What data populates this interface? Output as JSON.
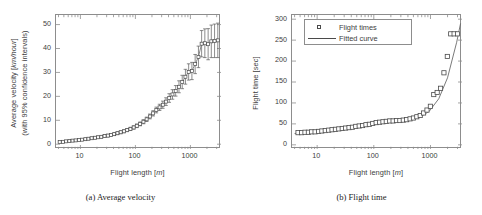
{
  "figure": {
    "panels": [
      {
        "id": "panel-a",
        "caption": "(a) Average velocity",
        "chart_index": 0
      },
      {
        "id": "panel-b",
        "caption": "(b) Flight time",
        "chart_index": 1
      }
    ]
  },
  "chart_data": [
    {
      "type": "scatter",
      "title": "",
      "panel_caption": "(a) Average velocity",
      "xlabel": "Flight length [m]",
      "xlabel_unit_italic": "m",
      "ylabel": "Average velocity [km/hour]",
      "ylabel_line2": "(with 95% confidence intervals)",
      "ylabel_unit_italic": "km/hour",
      "xscale": "log",
      "yscale": "linear",
      "xlim": [
        3.6,
        3600
      ],
      "ylim": [
        -2,
        54
      ],
      "xticks": [
        10,
        100,
        1000
      ],
      "xtick_labels": [
        "10",
        "100",
        "1000"
      ],
      "yticks": [
        0,
        10,
        20,
        30,
        40,
        50
      ],
      "ytick_labels": [
        "0",
        "10",
        "20",
        "30",
        "40",
        "50"
      ],
      "grid": false,
      "legend": null,
      "marker": "open-square",
      "has_error_bars": true,
      "error_bar_label": "95% confidence intervals",
      "series": [
        {
          "name": "Average velocity",
          "x": [
            4.2,
            4.8,
            5.5,
            6.3,
            7.2,
            8.2,
            9.4,
            10.7,
            12.3,
            14.0,
            16.0,
            18.4,
            21.0,
            24.0,
            27.5,
            31.5,
            36.0,
            41.2,
            47.2,
            54.0,
            62.0,
            71.0,
            81.2,
            93.0,
            106,
            122,
            140,
            160,
            183,
            210,
            240,
            275,
            315,
            360,
            412,
            472,
            540,
            620,
            710,
            812,
            930,
            1065,
            1220,
            1400,
            1600,
            1830,
            2100,
            2400,
            2750,
            3150
          ],
          "y": [
            0.9,
            1.0,
            1.2,
            1.3,
            1.5,
            1.6,
            1.8,
            1.9,
            2.1,
            2.3,
            2.5,
            2.7,
            2.9,
            3.1,
            3.4,
            3.6,
            3.9,
            4.2,
            4.6,
            5.0,
            5.4,
            5.9,
            6.4,
            7.0,
            7.7,
            8.5,
            9.4,
            10.4,
            11.6,
            12.9,
            14.3,
            15.4,
            16.5,
            17.8,
            19.3,
            20.8,
            22.3,
            24.0,
            26.0,
            28.2,
            30.2,
            30.6,
            33.5,
            36.5,
            42.0,
            42.2,
            41.8,
            43.0,
            43.2,
            43.4
          ],
          "yerr_lower": [
            0.35,
            0.35,
            0.38,
            0.4,
            0.4,
            0.4,
            0.42,
            0.42,
            0.45,
            0.45,
            0.45,
            0.48,
            0.5,
            0.5,
            0.52,
            0.55,
            0.55,
            0.58,
            0.6,
            0.6,
            0.62,
            0.65,
            0.68,
            0.7,
            0.75,
            0.8,
            0.85,
            0.9,
            1.0,
            1.1,
            1.2,
            1.3,
            1.5,
            1.6,
            1.8,
            2.0,
            2.2,
            2.5,
            2.8,
            3.1,
            3.4,
            3.6,
            4.0,
            4.5,
            5.5,
            6.0,
            6.5,
            6.8,
            7.0,
            7.2
          ],
          "yerr_upper": [
            0.35,
            0.35,
            0.38,
            0.4,
            0.4,
            0.4,
            0.42,
            0.42,
            0.45,
            0.45,
            0.45,
            0.48,
            0.5,
            0.5,
            0.52,
            0.55,
            0.55,
            0.58,
            0.6,
            0.6,
            0.62,
            0.65,
            0.68,
            0.7,
            0.75,
            0.8,
            0.85,
            0.9,
            1.0,
            1.1,
            1.2,
            1.3,
            1.5,
            1.6,
            1.8,
            2.0,
            2.2,
            2.5,
            2.8,
            3.1,
            3.4,
            3.6,
            4.0,
            4.5,
            5.5,
            6.0,
            6.5,
            6.8,
            7.0,
            7.2
          ]
        }
      ]
    },
    {
      "type": "scatter",
      "title": "",
      "panel_caption": "(b) Flight time",
      "xlabel": "Flight length [m]",
      "xlabel_unit_italic": "m",
      "ylabel": "Flight time [sec]",
      "xscale": "log",
      "yscale": "linear",
      "xlim": [
        3.6,
        3600
      ],
      "ylim": [
        -10,
        310
      ],
      "xticks": [
        10,
        100,
        1000
      ],
      "xtick_labels": [
        "10",
        "100",
        "1000"
      ],
      "yticks": [
        0,
        50,
        100,
        150,
        200,
        250,
        300
      ],
      "ytick_labels": [
        "0",
        "50",
        "100",
        "150",
        "200",
        "250",
        "300"
      ],
      "grid": false,
      "legend": {
        "position": "top-left",
        "entries": [
          {
            "label": "Flight times",
            "symbol": "open-square"
          },
          {
            "label": "Fitted curve",
            "symbol": "line"
          }
        ]
      },
      "series": [
        {
          "name": "Flight times",
          "symbol": "open-square",
          "x": [
            4.6,
            5.3,
            6.1,
            7.0,
            8.0,
            9.2,
            10.6,
            12.1,
            13.9,
            16.0,
            18.3,
            21.0,
            24.1,
            27.7,
            31.8,
            36.5,
            41.9,
            48.0,
            55.2,
            63.3,
            72.7,
            83.4,
            95.7,
            110,
            126,
            145,
            166,
            191,
            219,
            251,
            288,
            331,
            380,
            436,
            500,
            574,
            659,
            756,
            868,
            996,
            1143,
            1312,
            1506,
            1728,
            1983,
            2276,
            2612,
            2998
          ],
          "y": [
            29,
            29,
            30,
            30,
            31,
            31,
            32,
            33,
            34,
            35,
            36,
            37,
            38,
            39,
            40,
            41,
            42,
            44,
            45,
            46,
            48,
            49,
            51,
            53,
            54,
            55,
            56,
            57,
            57,
            58,
            58,
            59,
            60,
            62,
            64,
            67,
            70,
            76,
            83,
            92,
            120,
            125,
            135,
            172,
            211,
            265,
            265,
            265
          ]
        },
        {
          "name": "Fitted curve",
          "symbol": "line",
          "x": [
            4.0,
            6,
            9,
            14,
            20,
            30,
            45,
            65,
            95,
            140,
            200,
            300,
            440,
            650,
            950,
            1400,
            2000,
            2900,
            3400
          ],
          "y": [
            27,
            29,
            31,
            34,
            36,
            39,
            42,
            46,
            50,
            53,
            56,
            58,
            61,
            66,
            80,
            110,
            160,
            245,
            290
          ]
        }
      ]
    }
  ]
}
